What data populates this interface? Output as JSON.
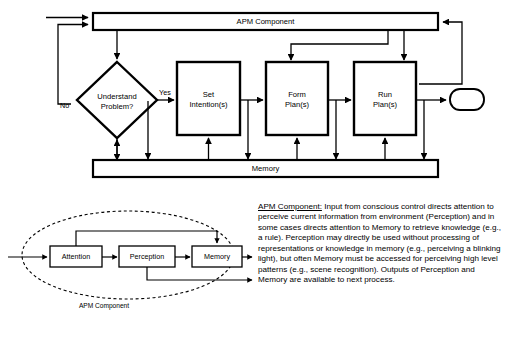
{
  "figure": {
    "top_bar": {
      "label": "APM Component"
    },
    "memory_bar": {
      "label": "Memory"
    },
    "decision": {
      "label_line1": "Understand",
      "label_line2": "Problem?"
    },
    "branches": {
      "yes": "Yes",
      "no": "No"
    },
    "processes": [
      {
        "line1": "Set",
        "line2": "Intention(s)"
      },
      {
        "line1": "Form",
        "line2": "Plan(s)"
      },
      {
        "line1": "Run",
        "line2": "Plan(s)"
      }
    ],
    "terminal": {
      "label": ""
    }
  },
  "detail": {
    "caption": "APM Component",
    "boxes": [
      {
        "label": "Attention"
      },
      {
        "label": "Perception"
      },
      {
        "label": "Memory"
      }
    ]
  },
  "note": {
    "heading": "APM Component:",
    "body": " Input from conscious control directs attention to perceive current information from environment (Perception) and in some cases directs attention to Memory to retrieve knowledge (e.g., a rule). Perception may directly be used without processing of representations or knowledge in memory (e.g., perceiving a blinking light), but often Memory must be accessed for perceiving high level patterns (e.g., scene recognition).  Outputs of Perception and Memory are available to next process."
  },
  "colors": {
    "stroke": "#000000",
    "background": "#ffffff"
  }
}
